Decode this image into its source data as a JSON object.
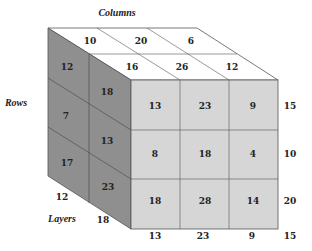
{
  "labels": {
    "columns": "Columns",
    "rows": "Rows",
    "layers": "Layers"
  },
  "colors": {
    "front": "#d6d6d6",
    "side": "#8f8f8f",
    "top": "#ffffff",
    "line": "#555555"
  },
  "front_face": {
    "rows": [
      [
        "13",
        "23",
        "9"
      ],
      [
        "8",
        "18",
        "4"
      ],
      [
        "18",
        "28",
        "14"
      ]
    ]
  },
  "top_face": {
    "back_row": [
      "10",
      "20",
      "6"
    ],
    "front_row": [
      "16",
      "26",
      "12"
    ]
  },
  "side_face": {
    "back_column": [
      "12",
      "7",
      "17"
    ],
    "front_column": [
      "18",
      "13",
      "23"
    ]
  },
  "row_totals": [
    "15",
    "10",
    "20"
  ],
  "column_totals": [
    "13",
    "23",
    "9",
    "15"
  ],
  "layer_totals": [
    "12",
    "18"
  ]
}
